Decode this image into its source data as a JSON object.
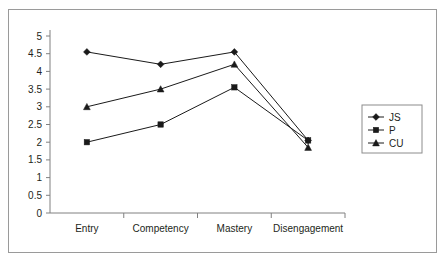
{
  "chart_data": {
    "type": "line",
    "title": "",
    "xlabel": "",
    "ylabel": "",
    "categories": [
      "Entry",
      "Competency",
      "Mastery",
      "Disengagement"
    ],
    "ylim": [
      0,
      5
    ],
    "ytick_labels": [
      "0",
      "0.5",
      "1",
      "1.5",
      "2",
      "2.5",
      "3",
      "3.5",
      "4",
      "4.5",
      "5"
    ],
    "ytick_values": [
      0,
      0.5,
      1,
      1.5,
      2,
      2.5,
      3,
      3.5,
      4,
      4.5,
      5
    ],
    "grid": false,
    "legend_position": "right",
    "series": [
      {
        "name": "JS",
        "marker": "diamond",
        "values": [
          4.55,
          4.2,
          4.55,
          2.05
        ]
      },
      {
        "name": "P",
        "marker": "square",
        "values": [
          2.0,
          2.5,
          3.55,
          2.05
        ]
      },
      {
        "name": "CU",
        "marker": "triangle",
        "values": [
          3.0,
          3.5,
          4.2,
          1.85
        ]
      }
    ]
  },
  "colors": {
    "line": "#1a1a1a",
    "axis": "#808080",
    "frame": "#9a9a9a",
    "text": "#231f20",
    "background": "#ffffff"
  }
}
